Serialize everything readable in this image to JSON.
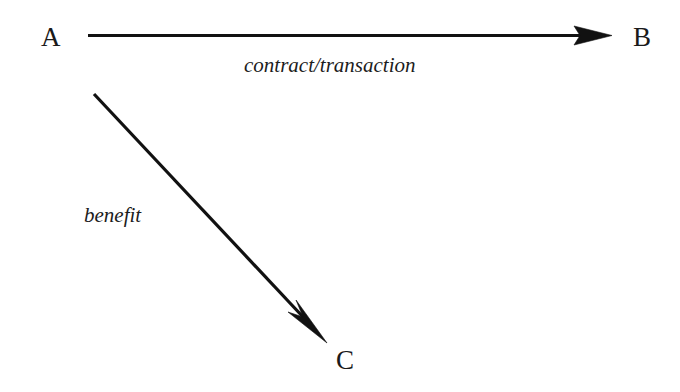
{
  "diagram": {
    "background_color": "#ffffff",
    "stroke_color": "#111111",
    "nodes": [
      {
        "id": "A",
        "label": "A",
        "x": 52,
        "y": 38
      },
      {
        "id": "B",
        "label": "B",
        "x": 643,
        "y": 38
      },
      {
        "id": "C",
        "label": "C",
        "x": 347,
        "y": 360
      }
    ],
    "edges": [
      {
        "id": "a-to-b",
        "from": "A",
        "to": "B",
        "label": "contract/transaction",
        "direction": "horizontal-right",
        "x1": 88,
        "y1": 35,
        "x2": 612,
        "y2": 35,
        "stroke_width": 3,
        "arrowhead": "solid-triangle"
      },
      {
        "id": "a-to-c",
        "from": "A",
        "to": "C",
        "label": "benefit",
        "direction": "diagonal-down-right",
        "x1": 94,
        "y1": 94,
        "x2": 327,
        "y2": 343,
        "stroke_width": 3,
        "arrowhead": "solid-triangle"
      }
    ]
  }
}
